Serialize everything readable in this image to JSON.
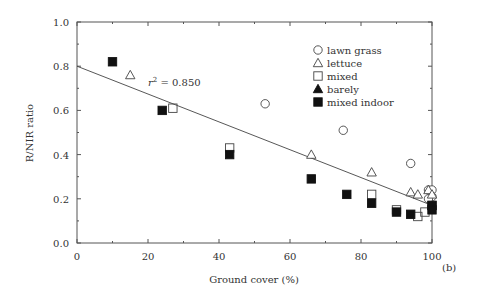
{
  "chart_data": {
    "type": "scatter",
    "title": "",
    "xlabel": "Ground cover (%)",
    "ylabel": "R/NIR ratio",
    "xlim": [
      0,
      100
    ],
    "ylim": [
      0.0,
      1.0
    ],
    "xticks": [
      0,
      20,
      40,
      60,
      80,
      100
    ],
    "yticks": [
      0.0,
      0.2,
      0.4,
      0.6,
      0.8,
      1.0
    ],
    "xtick_labels": [
      "0",
      "20",
      "40",
      "60",
      "80",
      "100"
    ],
    "ytick_labels": [
      "0.0",
      "0.2",
      "0.4",
      "0.6",
      "0.8",
      "1.0"
    ],
    "grid": false,
    "legend_position": "top-right",
    "panel_label": "(b)",
    "annotation": {
      "text_prefix": "r",
      "text_sup": "2",
      "text_suffix": " = 0.850",
      "x": 20,
      "y": 0.7
    },
    "regression_line": {
      "x": [
        0,
        100
      ],
      "y": [
        0.8,
        0.17
      ]
    },
    "series": [
      {
        "name": "lawn grass",
        "marker": "circle-open",
        "x": [
          53,
          75,
          94,
          99,
          100,
          100,
          99
        ],
        "y": [
          0.63,
          0.51,
          0.36,
          0.24,
          0.24,
          0.21,
          0.2
        ]
      },
      {
        "name": "lettuce",
        "marker": "triangle-open",
        "x": [
          15,
          66,
          83,
          94,
          96,
          99,
          100
        ],
        "y": [
          0.76,
          0.4,
          0.32,
          0.23,
          0.22,
          0.24,
          0.22
        ]
      },
      {
        "name": "mixed",
        "marker": "square-open",
        "x": [
          27,
          43,
          83,
          90,
          96,
          98,
          100
        ],
        "y": [
          0.61,
          0.43,
          0.22,
          0.15,
          0.12,
          0.14,
          0.17
        ]
      },
      {
        "name": "barely",
        "marker": "triangle-filled",
        "x": [],
        "y": []
      },
      {
        "name": "mixed indoor",
        "marker": "square-filled",
        "x": [
          10,
          24,
          43,
          66,
          76,
          83,
          90,
          94,
          100,
          100
        ],
        "y": [
          0.82,
          0.6,
          0.4,
          0.29,
          0.22,
          0.18,
          0.14,
          0.13,
          0.17,
          0.15
        ]
      }
    ]
  }
}
